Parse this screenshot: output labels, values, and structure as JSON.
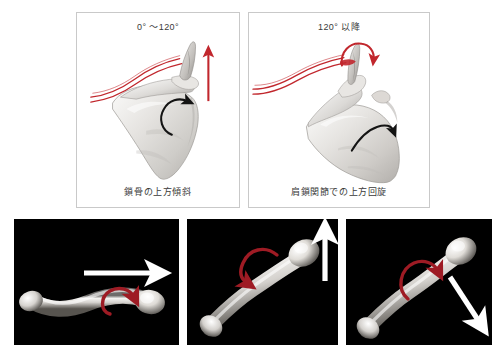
{
  "figure": {
    "top_panels": [
      {
        "id": "early-phase",
        "heading": "0° 〜120°",
        "caption": "鎖骨の上方傾斜",
        "bone_label": "scapula",
        "clavicle_label": "clavicle-red-outline",
        "arrows": [
          {
            "name": "red-straight-up-arrow",
            "color": "#c1272d",
            "direction": "up"
          },
          {
            "name": "black-curved-rotation-arrow",
            "color": "#111111",
            "direction": "counterclockwise"
          }
        ]
      },
      {
        "id": "late-phase",
        "heading": "120° 以降",
        "caption": "肩鎖関節での上方回旋",
        "bone_label": "scapula-rotated",
        "clavicle_label": "clavicle-red-outline",
        "arrows": [
          {
            "name": "red-curved-rotation-arrow",
            "color": "#c1272d",
            "direction": "clockwise"
          },
          {
            "name": "black-curved-rotation-arrow",
            "color": "#111111",
            "direction": "counterclockwise"
          }
        ]
      }
    ],
    "photos": [
      {
        "id": "clavicle-horizontal",
        "bone_label": "clavicle-specimen",
        "straight_arrow": {
          "name": "white-right-arrow",
          "color": "#ffffff",
          "direction": "right"
        },
        "curved_arrow": {
          "name": "red-curved-rotation-arrow",
          "color": "#9e1b24",
          "direction": "clockwise"
        }
      },
      {
        "id": "clavicle-elevated",
        "bone_label": "clavicle-specimen",
        "straight_arrow": {
          "name": "white-up-arrow",
          "color": "#ffffff",
          "direction": "up"
        },
        "curved_arrow": {
          "name": "red-curved-rotation-arrow",
          "color": "#9e1b24",
          "direction": "counterclockwise"
        }
      },
      {
        "id": "clavicle-depressed",
        "bone_label": "clavicle-specimen",
        "straight_arrow": {
          "name": "white-down-right-arrow",
          "color": "#ffffff",
          "direction": "down-right"
        },
        "curved_arrow": {
          "name": "red-curved-rotation-arrow",
          "color": "#9e1b24",
          "direction": "clockwise"
        }
      }
    ],
    "colors": {
      "accent_red": "#c1272d",
      "photo_red": "#9e1b24",
      "panel_border": "#c9c9c9",
      "photo_background": "#000000",
      "page_background": "#ffffff",
      "bone_light": "#f2f1ef",
      "bone_mid": "#d8d6d3",
      "bone_shadow": "#a9a6a2"
    }
  }
}
